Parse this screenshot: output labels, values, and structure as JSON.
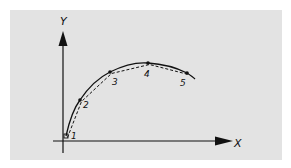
{
  "diagram": {
    "background_color": "#e3e3e3",
    "ink_color": "#111111",
    "axes": {
      "x_label": "X",
      "y_label": "Y"
    },
    "points": [
      {
        "label": "1",
        "x": 66,
        "y": 136
      },
      {
        "label": "2",
        "x": 80,
        "y": 100
      },
      {
        "label": "3",
        "x": 110,
        "y": 72
      },
      {
        "label": "4",
        "x": 148,
        "y": 63
      },
      {
        "label": "5",
        "x": 187,
        "y": 73
      }
    ],
    "curves": {
      "solid": "smooth curve through points",
      "dashed": "polyline approximation connecting points"
    }
  }
}
